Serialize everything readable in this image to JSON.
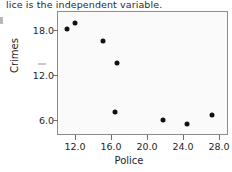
{
  "caption": {
    "text": "lice is the independent variable."
  },
  "chart_data": {
    "type": "scatter",
    "title": "",
    "xlabel": "Police",
    "ylabel": "Crimes",
    "xlim": [
      9.0,
      28.0
    ],
    "ylim": [
      4.0,
      20.5
    ],
    "grid": false,
    "legend": null,
    "xticks": [
      "12.0",
      "16.0",
      "20.0",
      "24.0",
      "28.0"
    ],
    "xtick_values": [
      12.0,
      16.0,
      20.0,
      24.0,
      28.0
    ],
    "yticks": [
      "6.0",
      "12.0",
      "18.0"
    ],
    "ytick_values": [
      6.0,
      12.0,
      18.0
    ],
    "series": [
      {
        "name": "Police vs Crimes",
        "marker": "filled-circle",
        "color": "#111111",
        "points": [
          {
            "x": 11.0,
            "y": 18.3
          },
          {
            "x": 11.9,
            "y": 19.1
          },
          {
            "x": 15.0,
            "y": 16.7
          },
          {
            "x": 16.6,
            "y": 13.7
          },
          {
            "x": 16.3,
            "y": 7.2
          },
          {
            "x": 21.7,
            "y": 6.1
          },
          {
            "x": 24.3,
            "y": 5.6
          },
          {
            "x": 27.1,
            "y": 6.8
          }
        ]
      }
    ]
  }
}
